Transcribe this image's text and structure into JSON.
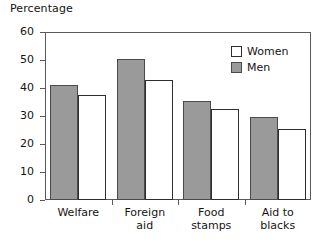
{
  "chart_data": {
    "type": "bar",
    "title": "Percentage",
    "xlabel": "",
    "ylabel": "Percentage",
    "ylim": [
      0,
      60
    ],
    "yticks": [
      0,
      10,
      20,
      30,
      40,
      50,
      60
    ],
    "grid": false,
    "legend_position": "top-right-inside",
    "categories": [
      "Welfare",
      "Foreign aid",
      "Food stamps",
      "Aid to blacks"
    ],
    "category_lines": [
      [
        "Welfare"
      ],
      [
        "Foreign",
        "aid"
      ],
      [
        "Food",
        "stamps"
      ],
      [
        "Aid to",
        "blacks"
      ]
    ],
    "series": [
      {
        "name": "Men",
        "color": "#9a9a9a",
        "values": [
          41,
          50.5,
          35.5,
          29.5
        ]
      },
      {
        "name": "Women",
        "color": "#ffffff",
        "values": [
          37.5,
          43,
          32.5,
          25.5
        ]
      }
    ]
  },
  "legend": {
    "items": [
      {
        "label": "Women"
      },
      {
        "label": "Men"
      }
    ]
  },
  "colors": {
    "men_fill": "#9a9a9a",
    "women_fill": "#ffffff",
    "bar_stroke": "#2e2e2e",
    "axis": "#5a5a5a",
    "text": "#141414"
  }
}
